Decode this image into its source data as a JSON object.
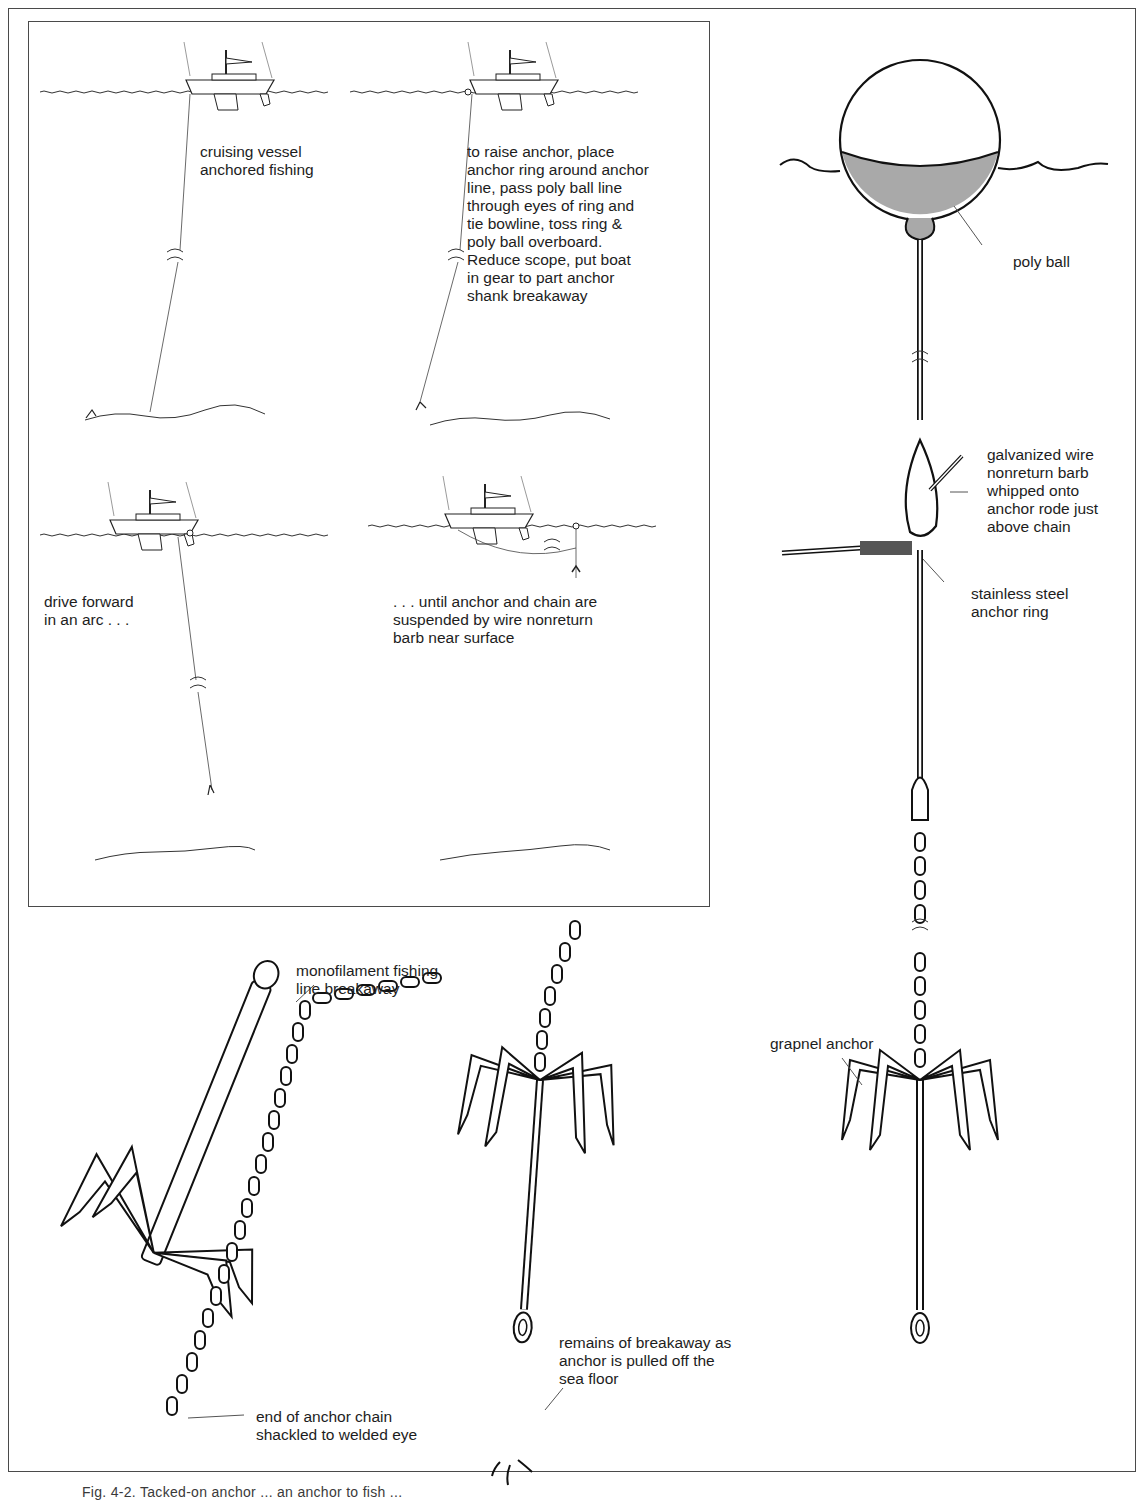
{
  "figure": {
    "caption_fragment": "Fig. 4-2. Tacked-on anchor ... an anchor to fish ..."
  },
  "inset_panels": [
    {
      "id": "panel-1",
      "label": "cruising vessel\nanchored fishing"
    },
    {
      "id": "panel-2",
      "label": "to raise anchor, place\nanchor ring around anchor\nline, pass poly ball line\nthrough eyes of ring and\ntie bowline, toss ring &\npoly ball overboard.\nReduce scope, put boat\nin gear to part anchor\nshank breakaway"
    },
    {
      "id": "panel-3",
      "label": "drive forward\nin an arc . . ."
    },
    {
      "id": "panel-4",
      "label": ". . . until anchor and chain are\nsuspended by wire nonreturn\nbarb near surface"
    }
  ],
  "callouts": {
    "poly_ball": "poly ball",
    "nonreturn_barb": "galvanized wire\nnonreturn barb\nwhipped onto\nanchor rode just\nabove chain",
    "anchor_ring": "stainless steel\nanchor ring",
    "grapnel_anchor": "grapnel anchor",
    "monofilament_breakaway": "monofilament fishing\nline breakaway",
    "chain_shackled": "end of anchor chain\nshackled to welded eye",
    "breakaway_remains": "remains of breakaway as\nanchor is pulled off the\nsea floor"
  },
  "colors": {
    "line": "#1a1a1a",
    "frame": "#4a4a4a",
    "water_fill": "#a9a9a9",
    "background": "#ffffff"
  }
}
